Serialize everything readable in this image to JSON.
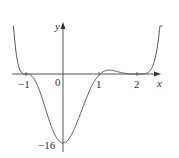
{
  "chart_data": {
    "type": "line",
    "title": "",
    "xlabel": "x",
    "ylabel": "y",
    "function": "f(x) = (x+1)^3 (x-1) (x-2)^4",
    "x_ticks": [
      "-1",
      "0",
      "1",
      "2"
    ],
    "y_ticks": [
      "-16"
    ],
    "key_points": [
      {
        "x": -1,
        "y": 0,
        "note": "inflection zero crossing"
      },
      {
        "x": 0,
        "y": -16,
        "note": "y-intercept / near minimum"
      },
      {
        "x": 1,
        "y": 0,
        "note": "zero crossing"
      },
      {
        "x": 2,
        "y": 0,
        "note": "touches axis (flat)"
      }
    ],
    "xlim": [
      -1.4,
      2.5
    ],
    "ylim": [
      -18,
      11
    ],
    "grid": false,
    "legend": null
  },
  "labels": {
    "x_axis": "x",
    "y_axis": "y",
    "tick_neg1": "−1",
    "tick_0": "0",
    "tick_1": "1",
    "tick_2": "2",
    "tick_neg16": "−16"
  },
  "colors": {
    "curve": "#555555",
    "axis": "#444444"
  }
}
